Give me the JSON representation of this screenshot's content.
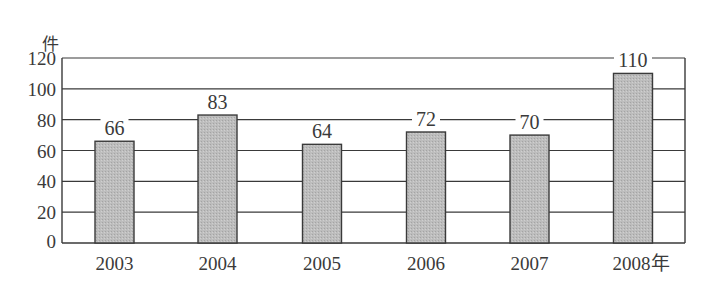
{
  "chart_data": {
    "type": "bar",
    "title": "",
    "xlabel": "",
    "ylabel": "件",
    "x_unit": "年",
    "categories": [
      "2003",
      "2004",
      "2005",
      "2006",
      "2007",
      "2008年"
    ],
    "values": [
      66,
      83,
      64,
      72,
      70,
      110
    ],
    "value_labels": [
      "66",
      "83",
      "64",
      "72",
      "70",
      "110"
    ],
    "yticks": [
      "0",
      "20",
      "40",
      "60",
      "80",
      "100",
      "120"
    ],
    "ylim": [
      0,
      120
    ],
    "grid": true,
    "legend": null,
    "colors": {
      "bar_fill": "#b5b5b5",
      "bar_stroke": "#3a3a3a",
      "grid": "#3a3a3a",
      "text": "#3a3a3a"
    }
  }
}
